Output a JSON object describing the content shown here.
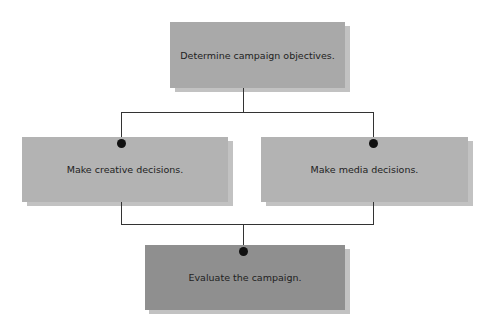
{
  "diagram": {
    "nodes": [
      {
        "id": "objectives",
        "label": "Determine campaign objectives.",
        "color": "#a9a9a9"
      },
      {
        "id": "creative",
        "label": "Make creative decisions.",
        "color": "#b3b3b3"
      },
      {
        "id": "media",
        "label": "Make media decisions.",
        "color": "#b3b3b3"
      },
      {
        "id": "evaluate",
        "label": "Evaluate the campaign.",
        "color": "#8f8f8f"
      }
    ],
    "edges": [
      {
        "from": "objectives",
        "to": "creative"
      },
      {
        "from": "objectives",
        "to": "media"
      },
      {
        "from": "creative",
        "to": "evaluate"
      },
      {
        "from": "media",
        "to": "evaluate"
      }
    ]
  }
}
